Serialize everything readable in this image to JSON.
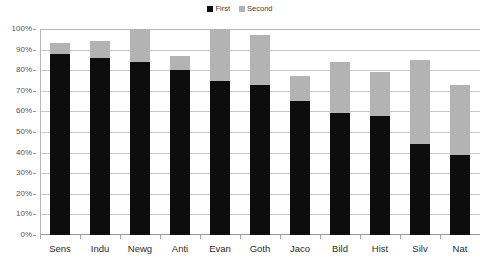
{
  "chart_data": {
    "type": "bar",
    "subtype": "stacked-vertical",
    "title": "",
    "subtitle": "",
    "xlabel": "",
    "ylabel": "",
    "ylim": [
      0,
      100
    ],
    "y_tick_labels": [
      "0%",
      "10%",
      "20%",
      "30%",
      "40%",
      "50%",
      "60%",
      "70%",
      "80%",
      "90%",
      "100%"
    ],
    "y_tick_values": [
      0,
      10,
      20,
      30,
      40,
      50,
      60,
      70,
      80,
      90,
      100
    ],
    "grid": true,
    "grid_axis": "y",
    "legend_position": "top-center",
    "categories": [
      "Sens",
      "Indu",
      "Newg",
      "Anti",
      "Evan",
      "Goth",
      "Jaco",
      "Bild",
      "Hist",
      "Silv",
      "Nat"
    ],
    "series": [
      {
        "name": "First",
        "color": "#0d0d0d",
        "values": [
          88,
          86,
          84,
          80,
          75,
          73,
          65,
          59,
          58,
          44,
          39
        ]
      },
      {
        "name": "Second",
        "color": "#b3b3b3",
        "values": [
          5,
          8,
          16,
          7,
          25,
          24,
          12,
          25,
          21,
          41,
          34
        ]
      }
    ],
    "totals": [
      93,
      94,
      100,
      87,
      100,
      97,
      77,
      84,
      79,
      85,
      73
    ],
    "plot_background": "#ffffff",
    "gridline_color": "#c9c9c9",
    "axis_color": "#9a9a9a"
  },
  "legend": {
    "entries": [
      {
        "label": "First",
        "color": "#0d0d0d"
      },
      {
        "label": "Second",
        "color": "#b3b3b3"
      }
    ]
  }
}
